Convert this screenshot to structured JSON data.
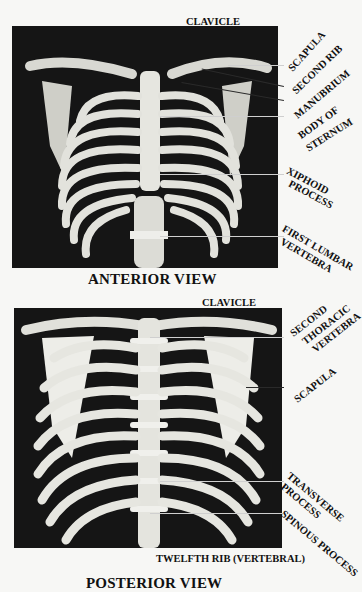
{
  "figure": {
    "anterior": {
      "caption": "ANTERIOR VIEW",
      "top_label": "CLAVICLE",
      "labels": [
        {
          "id": "scapula",
          "text": "SCAPULA"
        },
        {
          "id": "second_rib",
          "text": "SECOND RIB"
        },
        {
          "id": "manubrium",
          "text": "MANUBRIUM"
        },
        {
          "id": "body_of_sternum_1",
          "text": "BODY OF"
        },
        {
          "id": "body_of_sternum_2",
          "text": "STERNUM"
        },
        {
          "id": "xiphoid_1",
          "text": "XIPHOID"
        },
        {
          "id": "xiphoid_2",
          "text": "PROCESS"
        },
        {
          "id": "first_lumbar_1",
          "text": "FIRST LUMBAR"
        },
        {
          "id": "first_lumbar_2",
          "text": "VERTEBRA"
        }
      ]
    },
    "posterior": {
      "caption": "POSTERIOR VIEW",
      "top_label": "CLAVICLE",
      "bottom_label": "TWELFTH RIB (VERTEBRAL)",
      "labels": [
        {
          "id": "second_thoracic_1",
          "text": "SECOND"
        },
        {
          "id": "second_thoracic_2",
          "text": "THORACIC"
        },
        {
          "id": "second_thoracic_3",
          "text": "VERTEBRA"
        },
        {
          "id": "scapula",
          "text": "SCAPULA"
        },
        {
          "id": "transverse_1",
          "text": "TRANSVERSE"
        },
        {
          "id": "transverse_2",
          "text": "PROCESS"
        },
        {
          "id": "spinous",
          "text": "SPINOUS PROCESS"
        }
      ]
    }
  }
}
